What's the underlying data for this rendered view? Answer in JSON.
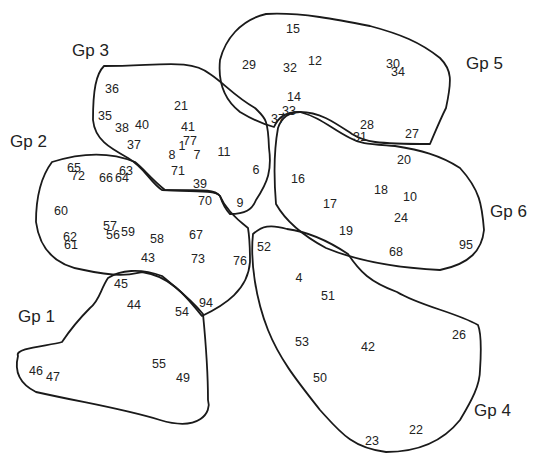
{
  "groups": [
    {
      "id": "gp1",
      "label": "Gp 1",
      "label_pos": [
        18,
        308
      ],
      "path": "M62,342 C48,346 14,348 18,356 C14,372 20,384 36,392 C90,404 120,408 160,420 C200,432 212,412 208,400 C208,370 206,345 203,314 C190,298 176,288 162,276 C140,268 120,270 108,278 C100,290 100,300 90,308 C80,318 70,330 62,342 Z",
      "members": [
        {
          "n": "45",
          "x": 121,
          "y": 284
        },
        {
          "n": "44",
          "x": 134,
          "y": 305
        },
        {
          "n": "54",
          "x": 182,
          "y": 312
        },
        {
          "n": "55",
          "x": 159,
          "y": 364
        },
        {
          "n": "46",
          "x": 36,
          "y": 371
        },
        {
          "n": "47",
          "x": 53,
          "y": 377
        },
        {
          "n": "49",
          "x": 183,
          "y": 378
        }
      ]
    },
    {
      "id": "gp2",
      "label": "Gp 2",
      "label_pos": [
        10,
        133
      ],
      "path": "M52,162 C40,178 36,200 36,222 C40,252 58,266 84,270 C120,278 132,274 142,272 C170,276 185,295 202,316 C225,305 248,290 250,262 C250,245 250,240 248,228 C235,218 225,208 220,196 C215,190 210,190 165,190 C150,178 145,170 135,162 C118,155 90,150 52,162 Z",
      "members": [
        {
          "n": "65",
          "x": 74,
          "y": 168
        },
        {
          "n": "72",
          "x": 78,
          "y": 176
        },
        {
          "n": "66",
          "x": 106,
          "y": 178
        },
        {
          "n": "63",
          "x": 126,
          "y": 171
        },
        {
          "n": "64",
          "x": 122,
          "y": 178
        },
        {
          "n": "60",
          "x": 61,
          "y": 211
        },
        {
          "n": "57",
          "x": 110,
          "y": 226
        },
        {
          "n": "56",
          "x": 113,
          "y": 235
        },
        {
          "n": "59",
          "x": 128,
          "y": 232
        },
        {
          "n": "62",
          "x": 70,
          "y": 237
        },
        {
          "n": "61",
          "x": 71,
          "y": 245
        },
        {
          "n": "58",
          "x": 157,
          "y": 239
        },
        {
          "n": "67",
          "x": 196,
          "y": 235
        },
        {
          "n": "43",
          "x": 148,
          "y": 258
        },
        {
          "n": "73",
          "x": 198,
          "y": 259
        },
        {
          "n": "76",
          "x": 240,
          "y": 261
        },
        {
          "n": "70",
          "x": 205,
          "y": 201
        },
        {
          "n": "94",
          "x": 206,
          "y": 303
        }
      ]
    },
    {
      "id": "gp3",
      "label": "Gp 3",
      "label_pos": [
        72,
        42
      ],
      "path": "M104,66 C96,74 93,90 93,120 C95,140 110,148 128,158 C145,168 150,182 162,190 C200,192 215,190 220,196 C224,208 228,212 230,214 C245,214 252,210 256,200 C268,182 272,170 269,148 C268,118 265,118 255,108 C234,96 225,84 210,74 C190,58 160,66 104,66 Z",
      "members": [
        {
          "n": "36",
          "x": 112,
          "y": 89
        },
        {
          "n": "21",
          "x": 181,
          "y": 106
        },
        {
          "n": "35",
          "x": 105,
          "y": 116
        },
        {
          "n": "38",
          "x": 122,
          "y": 128
        },
        {
          "n": "40",
          "x": 142,
          "y": 125
        },
        {
          "n": "41",
          "x": 188,
          "y": 127
        },
        {
          "n": "77",
          "x": 190,
          "y": 141
        },
        {
          "n": "37",
          "x": 134,
          "y": 145
        },
        {
          "n": "1",
          "x": 182,
          "y": 146
        },
        {
          "n": "8",
          "x": 172,
          "y": 155
        },
        {
          "n": "7",
          "x": 197,
          "y": 155
        },
        {
          "n": "11",
          "x": 224,
          "y": 152
        },
        {
          "n": "71",
          "x": 178,
          "y": 171
        },
        {
          "n": "6",
          "x": 256,
          "y": 170
        },
        {
          "n": "39",
          "x": 200,
          "y": 184
        },
        {
          "n": "9",
          "x": 240,
          "y": 203
        }
      ]
    },
    {
      "id": "gp4",
      "label": "Gp 4",
      "label_pos": [
        474,
        402
      ],
      "path": "M253,234 C250,262 256,300 268,330 C280,360 298,382 320,410 C340,432 352,448 386,452 C420,452 444,440 460,420 C472,400 480,385 480,370 C482,340 480,330 478,325 C455,312 420,306 397,292 C370,282 360,272 348,254 C330,242 310,232 287,229 C270,224 262,226 253,234 Z",
      "members": [
        {
          "n": "52",
          "x": 264,
          "y": 247
        },
        {
          "n": "4",
          "x": 299,
          "y": 278
        },
        {
          "n": "51",
          "x": 328,
          "y": 296
        },
        {
          "n": "26",
          "x": 459,
          "y": 335
        },
        {
          "n": "53",
          "x": 302,
          "y": 342
        },
        {
          "n": "42",
          "x": 368,
          "y": 347
        },
        {
          "n": "50",
          "x": 320,
          "y": 378
        },
        {
          "n": "22",
          "x": 416,
          "y": 430
        },
        {
          "n": "23",
          "x": 372,
          "y": 441
        }
      ]
    },
    {
      "id": "gp5",
      "label": "Gp 5",
      "label_pos": [
        466,
        55
      ],
      "path": "M266,14 C240,20 225,40 220,60 C218,80 222,98 240,112 C250,118 262,124 274,127 C278,118 284,112 300,112 C320,112 334,122 352,134 C365,142 375,144 430,144 C436,130 440,120 446,108 C452,80 452,70 440,58 C420,42 400,34 370,26 C340,20 300,12 266,14 Z",
      "members": [
        {
          "n": "15",
          "x": 293,
          "y": 29
        },
        {
          "n": "29",
          "x": 249,
          "y": 65
        },
        {
          "n": "32",
          "x": 290,
          "y": 68
        },
        {
          "n": "12",
          "x": 315,
          "y": 61
        },
        {
          "n": "30",
          "x": 393,
          "y": 64
        },
        {
          "n": "34",
          "x": 398,
          "y": 72
        },
        {
          "n": "14",
          "x": 294,
          "y": 97
        },
        {
          "n": "33",
          "x": 289,
          "y": 111
        },
        {
          "n": "37",
          "x": 278,
          "y": 119
        },
        {
          "n": "28",
          "x": 367,
          "y": 125
        },
        {
          "n": "31",
          "x": 360,
          "y": 137
        },
        {
          "n": "27",
          "x": 412,
          "y": 134
        }
      ]
    },
    {
      "id": "gp6",
      "label": "Gp 6",
      "label_pos": [
        490,
        203
      ],
      "path": "M278,128 C274,150 274,180 276,204 C285,220 300,234 326,248 C360,262 400,268 440,270 C470,264 482,250 484,230 C482,205 480,190 460,168 C440,155 420,150 395,146 C370,144 360,144 350,138 C330,128 322,118 300,112 C290,112 282,116 278,128 Z",
      "members": [
        {
          "n": "20",
          "x": 404,
          "y": 160
        },
        {
          "n": "16",
          "x": 298,
          "y": 179
        },
        {
          "n": "18",
          "x": 381,
          "y": 190
        },
        {
          "n": "10",
          "x": 410,
          "y": 197
        },
        {
          "n": "17",
          "x": 330,
          "y": 204
        },
        {
          "n": "24",
          "x": 401,
          "y": 218
        },
        {
          "n": "19",
          "x": 346,
          "y": 231
        },
        {
          "n": "68",
          "x": 396,
          "y": 252
        },
        {
          "n": "95",
          "x": 466,
          "y": 245
        }
      ]
    }
  ]
}
